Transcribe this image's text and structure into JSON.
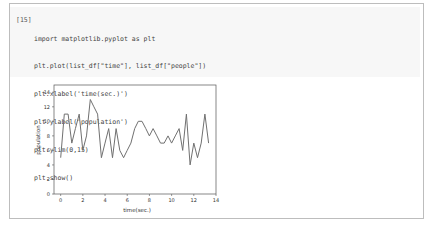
{
  "cell": {
    "prompt": "[15]",
    "code_lines": [
      "import matplotlib.pyplot as plt",
      "plt.plot(list_df[\"time\"], list_df[\"people\"])",
      "plt.xlabel('time(sec.)')",
      "plt.ylabel('population')",
      "plt.ylim(0,15)",
      "plt.show()"
    ]
  },
  "chart_data": {
    "type": "line",
    "title": "",
    "xlabel": "time(sec.)",
    "ylabel": "population",
    "xlim": [
      -0.6,
      14
    ],
    "ylim": [
      0,
      15
    ],
    "x_ticks": [
      0,
      2,
      4,
      6,
      8,
      10,
      12,
      14
    ],
    "y_ticks": [
      0,
      2,
      4,
      6,
      8,
      10,
      12,
      14
    ],
    "grid": false,
    "line_color": "#707070",
    "series": [
      {
        "name": "people",
        "x": [
          0,
          0.33,
          0.67,
          1.0,
          1.33,
          1.67,
          2.0,
          2.33,
          2.67,
          3.0,
          3.33,
          3.67,
          4.0,
          4.33,
          4.67,
          5.0,
          5.33,
          5.67,
          6.0,
          6.33,
          6.67,
          7.0,
          7.33,
          7.67,
          8.0,
          8.33,
          8.67,
          9.0,
          9.33,
          9.67,
          10.0,
          10.33,
          10.67,
          11.0,
          11.33,
          11.67,
          12.0,
          12.33,
          12.67,
          13.0,
          13.33
        ],
        "values": [
          5,
          11,
          11,
          7,
          9,
          11,
          6,
          8,
          13,
          12,
          11,
          5,
          7,
          9,
          5,
          9,
          6,
          5,
          6,
          7,
          9,
          10,
          10,
          9,
          8,
          9,
          8,
          7,
          7,
          8,
          7,
          8,
          9,
          6,
          11,
          4,
          7,
          5,
          7,
          11,
          7
        ]
      }
    ]
  }
}
